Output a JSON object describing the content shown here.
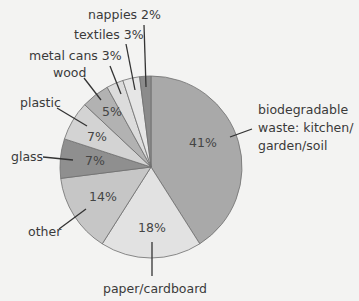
{
  "chart_data": {
    "type": "pie",
    "title": "",
    "start_angle": "12 o'clock, clockwise",
    "slices": [
      {
        "label": "biodegradable waste: kitchen/ garden/soil",
        "value": 41,
        "pct_label": "41%",
        "color": "#a9a9a9"
      },
      {
        "label": "paper/cardboard",
        "value": 18,
        "pct_label": "18%",
        "color": "#e2e2e2"
      },
      {
        "label": "other",
        "value": 14,
        "pct_label": "14%",
        "color": "#c6c6c6"
      },
      {
        "label": "glass",
        "value": 7,
        "pct_label": "7%",
        "color": "#8f8f8f"
      },
      {
        "label": "plastic",
        "value": 7,
        "pct_label": "7%",
        "color": "#d3d3d3"
      },
      {
        "label": "wood",
        "value": 5,
        "pct_label": "5%",
        "color": "#b2b2b2"
      },
      {
        "label": "metal cans",
        "value": 3,
        "pct_label": "3%",
        "color": "#dcdcdc"
      },
      {
        "label": "textiles",
        "value": 3,
        "pct_label": "3%",
        "color": "#e6e6e6"
      },
      {
        "label": "nappies",
        "value": 2,
        "pct_label": "2%",
        "color": "#8b8b8b"
      }
    ]
  },
  "labels": {
    "bio_line1": "biodegradable",
    "bio_line2": "waste: kitchen/",
    "bio_line3": "garden/soil",
    "paper": "paper/cardboard",
    "other": "other",
    "glass": "glass",
    "plastic": "plastic",
    "wood": "wood",
    "metal": "metal cans 3%",
    "textiles": "textiles 3%",
    "nappies": "nappies 2%"
  },
  "percent_labels": {
    "bio": "41%",
    "paper": "18%",
    "other": "14%",
    "glass": "7%",
    "plastic": "7%",
    "wood": "5%"
  }
}
